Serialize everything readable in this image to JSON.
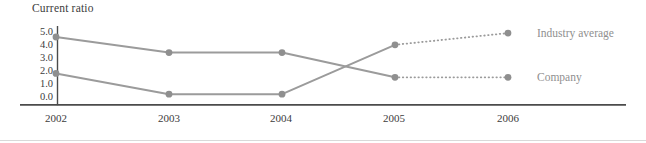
{
  "chart_data": {
    "type": "line",
    "title": "Current ratio",
    "xlabel": "",
    "ylabel": "Current ratio",
    "x_tick_labels": [
      "2002",
      "2003",
      "2004",
      "2005",
      "2006"
    ],
    "y_tick_labels": [
      "5.0",
      "4.0",
      "3.0",
      "2.0",
      "1.0",
      "0.0"
    ],
    "ylim": [
      0.0,
      5.0
    ],
    "grid": false,
    "legend_position": "right-of-line-endpoints",
    "series": [
      {
        "name": "Company",
        "values": [
          4.6,
          3.4,
          3.4,
          1.5,
          1.5
        ],
        "solid_through_index": 3,
        "dotted_projection_to_index": 4,
        "endpoint": "low"
      },
      {
        "name": "Industry average",
        "values": [
          1.8,
          0.2,
          0.2,
          4.0,
          4.9
        ],
        "solid_through_index": 3,
        "dotted_projection_to_index": 4,
        "endpoint": "high"
      }
    ],
    "annotations": {
      "industry_average_label": "Industry average",
      "company_label": "Company"
    },
    "colors": {
      "line": "#9b9b9b",
      "marker": "#8f8f8f",
      "axis": "#4b4b4b",
      "text": "#3c3c3c",
      "series_label_text": "#8f8f8f",
      "bottom_rule": "#d9d9d9"
    },
    "style_notes": "solid lines with round gray markers 2002-2005; fine dotted segments 2005-2006"
  }
}
